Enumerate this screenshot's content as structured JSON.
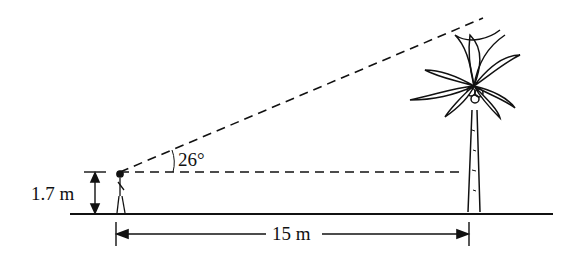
{
  "diagram": {
    "type": "angle-of-elevation",
    "labels": {
      "angle": "26°",
      "eye_height": "1.7 m",
      "distance": "15 m"
    },
    "objects": [
      "observer",
      "palm-tree"
    ],
    "colors": {
      "ink": "#111111",
      "background": "#ffffff"
    }
  }
}
